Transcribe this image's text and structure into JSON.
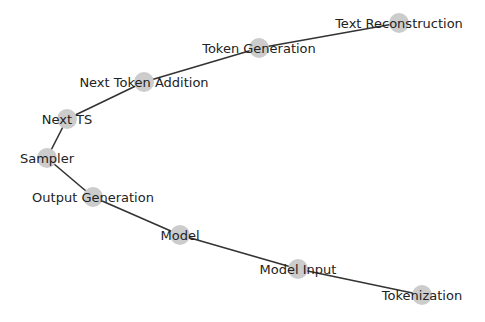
{
  "diagram": {
    "type": "graph",
    "node_color": "#cccccc",
    "edge_color": "#333333",
    "label_color": "#222222",
    "nodes": [
      {
        "id": "text_reconstruction",
        "label": "Text Reconstruction",
        "x": 399,
        "y": 23
      },
      {
        "id": "token_generation",
        "label": "Token Generation",
        "x": 259,
        "y": 48
      },
      {
        "id": "next_token_addition",
        "label": "Next Token Addition",
        "x": 144,
        "y": 82
      },
      {
        "id": "next_ts",
        "label": "Next TS",
        "x": 67,
        "y": 119
      },
      {
        "id": "sampler",
        "label": "Sampler",
        "x": 47,
        "y": 158
      },
      {
        "id": "output_generation",
        "label": "Output Generation",
        "x": 93,
        "y": 197
      },
      {
        "id": "model",
        "label": "Model",
        "x": 180,
        "y": 235
      },
      {
        "id": "model_input",
        "label": "Model Input",
        "x": 298,
        "y": 269
      },
      {
        "id": "tokenization",
        "label": "Tokenization",
        "x": 422,
        "y": 295
      }
    ],
    "edges": [
      [
        "text_reconstruction",
        "token_generation"
      ],
      [
        "token_generation",
        "next_token_addition"
      ],
      [
        "next_token_addition",
        "next_ts"
      ],
      [
        "next_ts",
        "sampler"
      ],
      [
        "sampler",
        "output_generation"
      ],
      [
        "output_generation",
        "model"
      ],
      [
        "model",
        "model_input"
      ],
      [
        "model_input",
        "tokenization"
      ]
    ]
  }
}
